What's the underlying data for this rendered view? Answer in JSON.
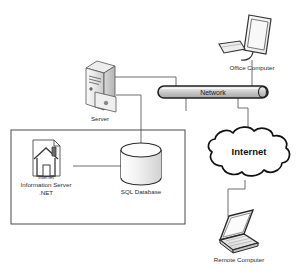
{
  "diagram": {
    "background_color": "#ffffff",
    "line_color": "#6e6e6e",
    "outline_color": "#2a2a2a",
    "text_color": "#2b2b2b"
  },
  "nodes": {
    "server": {
      "label": "Server",
      "icon": "server-tower-icon"
    },
    "network": {
      "label": "Network",
      "icon": "network-bus-icon"
    },
    "office_computer": {
      "label": "Office Computer",
      "icon": "desktop-monitor-icon"
    },
    "internet": {
      "label": "Internet",
      "icon": "cloud-icon"
    },
    "remote_computer": {
      "label": "Remote Computer",
      "icon": "laptop-icon"
    },
    "sql_database": {
      "label": "SQL Database",
      "icon": "database-cylinder-icon"
    },
    "iis": {
      "icon": "house-document-icon",
      "badge_label": "Internet",
      "label_line1": "Information Server",
      "label_line2": ".NET"
    }
  }
}
